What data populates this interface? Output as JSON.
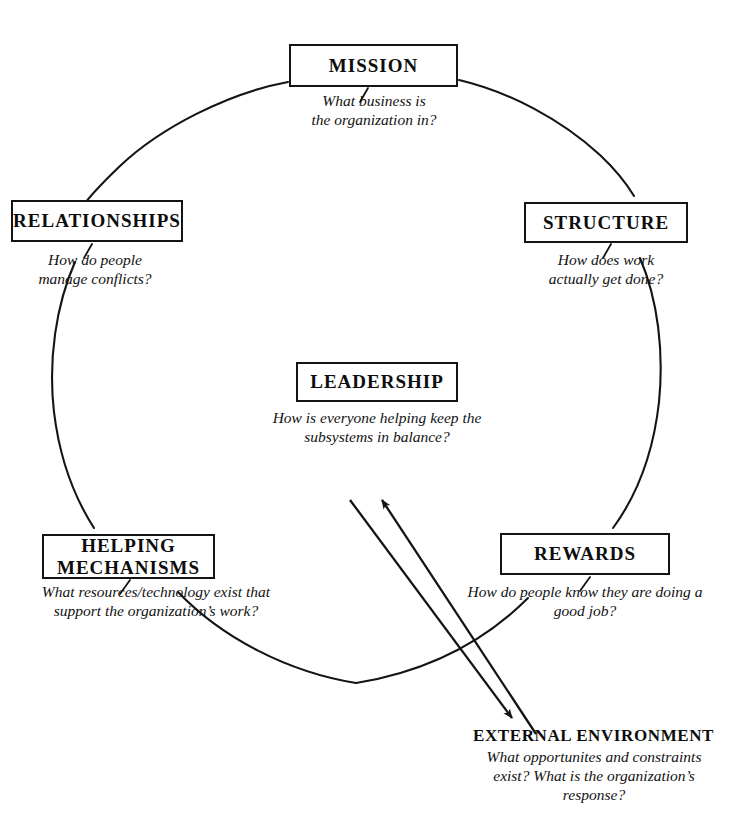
{
  "diagram": {
    "title_text": "",
    "ink_color": "#141414",
    "background_color": "#ffffff",
    "nodes": [
      {
        "id": "mission",
        "label": "MISSION",
        "caption": "What business is\nthe organization in?"
      },
      {
        "id": "structure",
        "label": "STRUCTURE",
        "caption": "How does work\nactually get done?"
      },
      {
        "id": "relationships",
        "label": "RELATIONSHIPS",
        "caption": "How  do people\nmanage conflicts?"
      },
      {
        "id": "leadership",
        "label": "LEADERSHIP",
        "caption": "How  is everyone helping keep the\nsubsystems in balance?"
      },
      {
        "id": "helping-mechanisms",
        "label": "HELPING\nMECHANISMS",
        "caption": "What resources/technology exist that\nsupport the organization’s work?"
      },
      {
        "id": "rewards",
        "label": "REWARDS",
        "caption": "How do  people know they are  doing a\ngood job?"
      }
    ],
    "external": {
      "title": "EXTERNAL ENVIRONMENT",
      "caption": "What opportunites and constraints\nexist? What is the organization’s\nresponse?"
    },
    "connectors": {
      "circle_label": "circle-connector",
      "arrow_up_label": "arrow-to-leadership",
      "arrow_down_label": "arrow-to-external-environment"
    }
  }
}
